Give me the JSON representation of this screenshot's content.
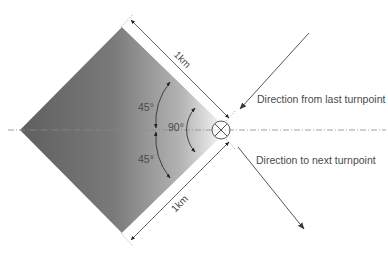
{
  "diagram": {
    "labels": {
      "incoming": "Direction from last turnpoint",
      "outgoing": "Direction to next turnpoint",
      "dimension_top": "1km",
      "dimension_bottom": "1km",
      "angle_upper": "45°",
      "angle_lower": "45°",
      "angle_inner": "90°"
    },
    "colors": {
      "sector_dark": "#6b6b6b",
      "sector_light": "#ffffff",
      "line": "#555555",
      "text": "#4a4a4a",
      "centerline": "#888888"
    },
    "elements": {
      "sector": "90-degree observation sector (square rotated 45°)",
      "turnpoint_marker": "circle with X",
      "centerline": "dash-dot bisector line"
    }
  }
}
